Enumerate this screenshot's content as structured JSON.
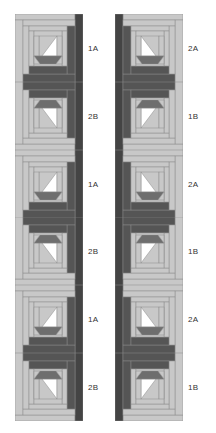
{
  "diagram": {
    "title": "",
    "colors": {
      "light": "#c8c8c8",
      "medium": "#a9a9a9",
      "dark": "#555555",
      "darker": "#444444",
      "white": "#ffffff",
      "outline": "#8a8a8a",
      "boat": "#6e6e6e"
    },
    "columns": [
      {
        "side": "left",
        "blocks": [
          {
            "label": "1A",
            "variant": "A"
          },
          {
            "label": "2B",
            "variant": "B"
          },
          {
            "label": "1A",
            "variant": "A"
          },
          {
            "label": "2B",
            "variant": "B"
          },
          {
            "label": "1A",
            "variant": "A"
          },
          {
            "label": "2B",
            "variant": "B"
          }
        ]
      },
      {
        "side": "right",
        "blocks": [
          {
            "label": "2A",
            "variant": "A"
          },
          {
            "label": "1B",
            "variant": "B"
          },
          {
            "label": "2A",
            "variant": "A"
          },
          {
            "label": "1B",
            "variant": "B"
          },
          {
            "label": "2A",
            "variant": "A"
          },
          {
            "label": "1B",
            "variant": "B"
          }
        ]
      }
    ]
  }
}
